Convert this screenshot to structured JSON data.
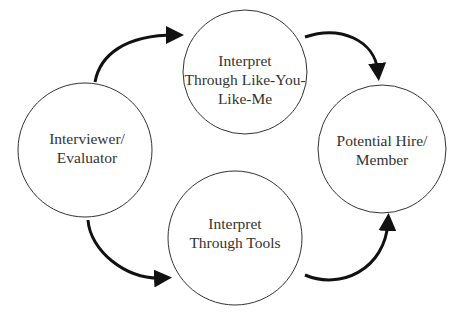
{
  "diagram": {
    "type": "cycle",
    "nodes": [
      {
        "id": "top",
        "label_lines": [
          "Interpret",
          "Through Like-You-",
          "Like-Me"
        ]
      },
      {
        "id": "left",
        "label_lines": [
          "Interviewer/",
          "Evaluator"
        ]
      },
      {
        "id": "right",
        "label_lines": [
          "Potential Hire/",
          "Member"
        ]
      },
      {
        "id": "bottom",
        "label_lines": [
          "Interpret",
          "Through Tools"
        ]
      }
    ],
    "edges": [
      {
        "from": "left",
        "to": "top"
      },
      {
        "from": "top",
        "to": "right"
      },
      {
        "from": "left",
        "to": "bottom"
      },
      {
        "from": "bottom",
        "to": "right"
      }
    ],
    "colors": {
      "stroke": "#333333",
      "arrow": "#111111",
      "text": "#333333"
    }
  }
}
